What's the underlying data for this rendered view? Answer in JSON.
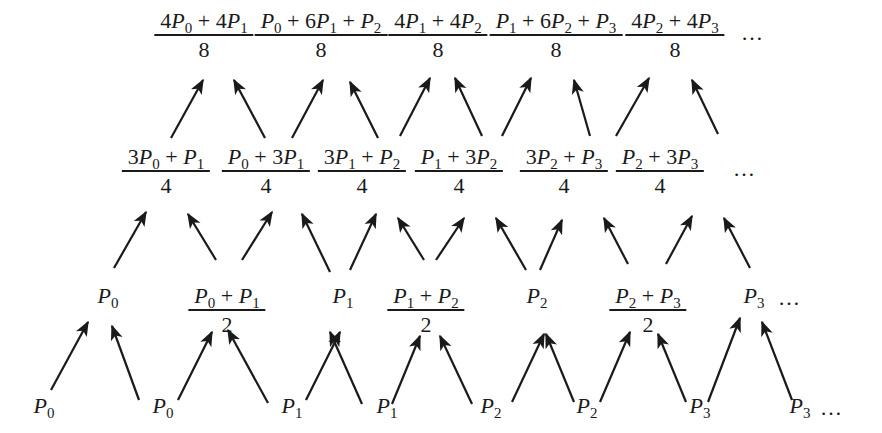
{
  "diagram": {
    "ellipsis": "…",
    "levels": [
      {
        "name": "level-3",
        "nodes": [
          {
            "num": [
              [
                "4",
                "P",
                "0"
              ],
              [
                "+"
              ],
              [
                "4",
                "P",
                "1"
              ]
            ],
            "den": "8"
          },
          {
            "num": [
              [
                "",
                "P",
                "0"
              ],
              [
                "+"
              ],
              [
                "6",
                "P",
                "1"
              ],
              [
                "+"
              ],
              [
                "",
                "P",
                "2"
              ]
            ],
            "den": "8"
          },
          {
            "num": [
              [
                "4",
                "P",
                "1"
              ],
              [
                "+"
              ],
              [
                "4",
                "P",
                "2"
              ]
            ],
            "den": "8"
          },
          {
            "num": [
              [
                "",
                "P",
                "1"
              ],
              [
                "+"
              ],
              [
                "6",
                "P",
                "2"
              ],
              [
                "+"
              ],
              [
                "",
                "P",
                "3"
              ]
            ],
            "den": "8"
          },
          {
            "num": [
              [
                "4",
                "P",
                "2"
              ],
              [
                "+"
              ],
              [
                "4",
                "P",
                "3"
              ]
            ],
            "den": "8"
          }
        ],
        "text": [
          "(4P0 + 4P1)/8",
          "(P0 + 6P1 + P2)/8",
          "(4P1 + 4P2)/8",
          "(P1 + 6P2 + P3)/8",
          "(4P2 + 4P3)/8",
          "..."
        ]
      },
      {
        "name": "level-2",
        "nodes": [
          {
            "num": [
              [
                "3",
                "P",
                "0"
              ],
              [
                "+"
              ],
              [
                "",
                "P",
                "1"
              ]
            ],
            "den": "4"
          },
          {
            "num": [
              [
                "",
                "P",
                "0"
              ],
              [
                "+"
              ],
              [
                "3",
                "P",
                "1"
              ]
            ],
            "den": "4"
          },
          {
            "num": [
              [
                "3",
                "P",
                "1"
              ],
              [
                "+"
              ],
              [
                "",
                "P",
                "2"
              ]
            ],
            "den": "4"
          },
          {
            "num": [
              [
                "",
                "P",
                "1"
              ],
              [
                "+"
              ],
              [
                "3",
                "P",
                "2"
              ]
            ],
            "den": "4"
          },
          {
            "num": [
              [
                "3",
                "P",
                "2"
              ],
              [
                "+"
              ],
              [
                "",
                "P",
                "3"
              ]
            ],
            "den": "4"
          },
          {
            "num": [
              [
                "",
                "P",
                "2"
              ],
              [
                "+"
              ],
              [
                "3",
                "P",
                "3"
              ]
            ],
            "den": "4"
          }
        ],
        "text": [
          "(3P0 + P1)/4",
          "(P0 + 3P1)/4",
          "(3P1 + P2)/4",
          "(P1 + 3P2)/4",
          "(3P2 + P3)/4",
          "(P2 + 3P3)/4",
          "..."
        ]
      },
      {
        "name": "level-1",
        "nodes": [
          {
            "plain": [
              "P",
              "0"
            ]
          },
          {
            "num": [
              [
                "",
                "P",
                "0"
              ],
              [
                "+"
              ],
              [
                "",
                "P",
                "1"
              ]
            ],
            "den": "2"
          },
          {
            "plain": [
              "P",
              "1"
            ]
          },
          {
            "num": [
              [
                "",
                "P",
                "1"
              ],
              [
                "+"
              ],
              [
                "",
                "P",
                "2"
              ]
            ],
            "den": "2"
          },
          {
            "plain": [
              "P",
              "2"
            ]
          },
          {
            "num": [
              [
                "",
                "P",
                "2"
              ],
              [
                "+"
              ],
              [
                "",
                "P",
                "3"
              ]
            ],
            "den": "2"
          },
          {
            "plain": [
              "P",
              "3"
            ]
          }
        ],
        "text": [
          "P0",
          "(P0 + P1)/2",
          "P1",
          "(P1 + P2)/2",
          "P2",
          "(P2 + P3)/2",
          "P3",
          "..."
        ]
      },
      {
        "name": "level-0",
        "nodes": [
          {
            "plain": [
              "P",
              "0"
            ]
          },
          {
            "plain": [
              "P",
              "0"
            ]
          },
          {
            "plain": [
              "P",
              "1"
            ]
          },
          {
            "plain": [
              "P",
              "1"
            ]
          },
          {
            "plain": [
              "P",
              "2"
            ]
          },
          {
            "plain": [
              "P",
              "2"
            ]
          },
          {
            "plain": [
              "P",
              "3"
            ]
          },
          {
            "plain": [
              "P",
              "3"
            ]
          }
        ],
        "text": [
          "P0",
          "P0",
          "P1",
          "P1",
          "P2",
          "P2",
          "P3",
          "P3",
          "..."
        ]
      }
    ],
    "layout": {
      "level-3": {
        "top": 10,
        "x": [
          204,
          321,
          438,
          556,
          675
        ],
        "ellipsis_x": 741
      },
      "level-2": {
        "top": 146,
        "x": [
          166,
          266,
          362,
          459,
          564,
          660
        ],
        "ellipsis_x": 733
      },
      "level-1": {
        "top": 285,
        "x": [
          108,
          227,
          343,
          426,
          537,
          648,
          754
        ],
        "ellipsis_x": 778
      },
      "level-0": {
        "top": 395,
        "x": [
          44,
          163,
          292,
          387,
          491,
          587,
          700,
          800
        ],
        "ellipsis_x": 820
      }
    },
    "arrows": [
      [
        51,
        390,
        88,
        322
      ],
      [
        139,
        400,
        112,
        326
      ],
      [
        178,
        400,
        212,
        332
      ],
      [
        268,
        403,
        228,
        330
      ],
      [
        306,
        400,
        340,
        332
      ],
      [
        362,
        404,
        330,
        332
      ],
      [
        392,
        404,
        420,
        336
      ],
      [
        472,
        404,
        440,
        336
      ],
      [
        512,
        402,
        544,
        334
      ],
      [
        574,
        402,
        546,
        334
      ],
      [
        600,
        402,
        630,
        332
      ],
      [
        686,
        402,
        658,
        334
      ],
      [
        708,
        402,
        740,
        318
      ],
      [
        792,
        400,
        762,
        322
      ],
      [
        114,
        268,
        146,
        212
      ],
      [
        216,
        260,
        188,
        214
      ],
      [
        242,
        260,
        272,
        212
      ],
      [
        330,
        272,
        302,
        214
      ],
      [
        350,
        270,
        376,
        214
      ],
      [
        424,
        260,
        398,
        218
      ],
      [
        436,
        260,
        464,
        218
      ],
      [
        526,
        270,
        496,
        218
      ],
      [
        540,
        270,
        562,
        220
      ],
      [
        628,
        264,
        604,
        218
      ],
      [
        666,
        264,
        692,
        216
      ],
      [
        750,
        268,
        724,
        218
      ],
      [
        171,
        138,
        203,
        80
      ],
      [
        265,
        138,
        234,
        80
      ],
      [
        292,
        138,
        323,
        80
      ],
      [
        378,
        138,
        350,
        82
      ],
      [
        400,
        136,
        430,
        78
      ],
      [
        482,
        136,
        455,
        78
      ],
      [
        502,
        136,
        531,
        78
      ],
      [
        590,
        136,
        574,
        80
      ],
      [
        616,
        136,
        649,
        78
      ],
      [
        718,
        134,
        692,
        80
      ]
    ],
    "colors": {
      "ink": "#1a1a1a",
      "background": "#ffffff"
    }
  }
}
